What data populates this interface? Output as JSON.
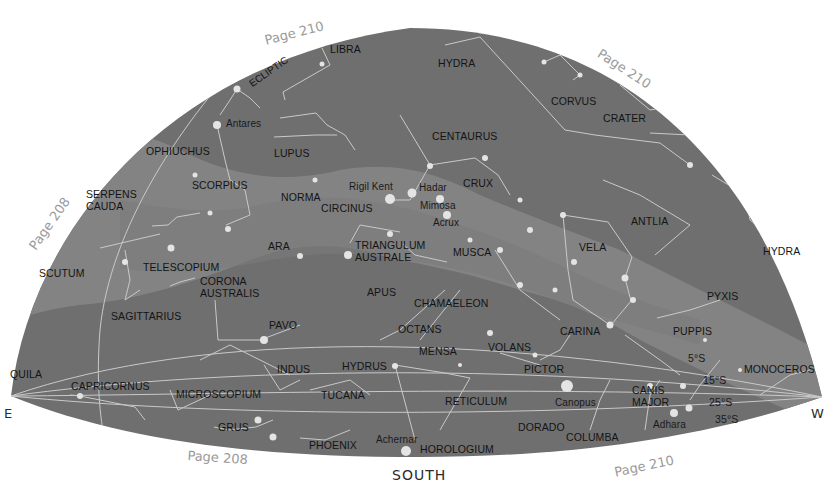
{
  "map": {
    "title": "Southern sky chart",
    "colors": {
      "sky": "#6f6f6f",
      "milky_way": "#878787",
      "lines": "#c9c9c9",
      "stars": "#e4e4e4",
      "page_labels": "#9a9a9a",
      "text": "#141414"
    },
    "compass": {
      "east": "E",
      "west": "W",
      "south": "SOUTH"
    },
    "ecliptic_label": "ECLIPTIC",
    "page_refs": [
      {
        "text": "Page 210",
        "position": "top-left"
      },
      {
        "text": "Page 210",
        "position": "top-right"
      },
      {
        "text": "Page 208",
        "position": "left"
      },
      {
        "text": "Page 208",
        "position": "bottom-left"
      },
      {
        "text": "Page 210",
        "position": "bottom-right"
      }
    ],
    "declination_labels": [
      "5°S",
      "15°S",
      "25°S",
      "35°S"
    ],
    "constellations": [
      "LIBRA",
      "HYDRA",
      "CORVUS",
      "CRATER",
      "OPHIUCHUS",
      "LUPUS",
      "CENTAURUS",
      "SCORPIUS",
      "SERPENS",
      "CAUDA",
      "NORMA",
      "CIRCINUS",
      "CRUX",
      "ANTLIA",
      "HYDRA",
      "ARA",
      "TRIANGULUM",
      "AUSTRALE",
      "MUSCA",
      "VELA",
      "SCUTUM",
      "TELESCOPIUM",
      "CORONA",
      "AUSTRALIS",
      "APUS",
      "PYXIS",
      "SAGITTARIUS",
      "CHAMAELEON",
      "PAVO",
      "OCTANS",
      "CARINA",
      "PUPPIS",
      "MENSA",
      "VOLANS",
      "INDUS",
      "HYDRUS",
      "PICTOR",
      "MONOCEROS",
      "QUILA",
      "CAPRICORNUS",
      "CANIS",
      "MAJOR",
      "MICROSCOPIUM",
      "TUCANA",
      "RETICULUM",
      "GRUS",
      "PHOENIX",
      "HOROLOGIUM",
      "DORADO",
      "COLUMBA"
    ],
    "stars": [
      "Antares",
      "Rigil Kent",
      "Hadar",
      "Mimosa",
      "Acrux",
      "Canopus",
      "Achernar",
      "Adhara"
    ]
  }
}
